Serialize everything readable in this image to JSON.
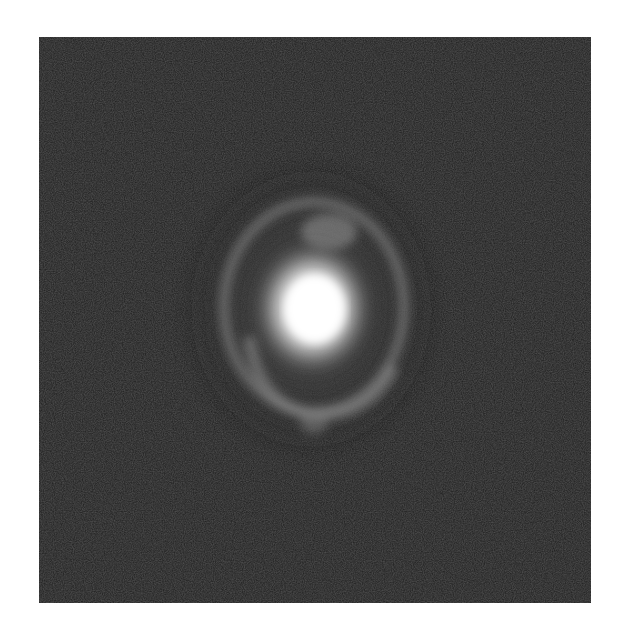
{
  "image": {
    "subject": "astronomical ring galaxy / Einstein ring with bright central core",
    "background_color": "#1e1e1e",
    "frame_color": "#ffffff",
    "core_color": "#ffffff",
    "ring_color": "#8a8a8a",
    "colormap": "grayscale"
  }
}
